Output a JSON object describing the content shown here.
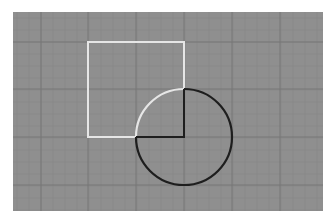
{
  "figure": {
    "width": 330,
    "height": 221,
    "background": "#ffffff",
    "panel": {
      "x": 13,
      "y": 12,
      "width": 310,
      "height": 199,
      "fill": "#8f8f8f"
    },
    "grid": {
      "major_color": "#777777",
      "minor_color": "#868686",
      "major_x": [
        41,
        88,
        136,
        184,
        232,
        280
      ],
      "major_y": [
        42,
        89,
        137,
        185
      ],
      "minor_step": 12
    },
    "square": {
      "x": 88,
      "y": 42,
      "width": 96,
      "height": 95,
      "stroke": "#e6e6e6",
      "stroke_width": 2
    },
    "circle": {
      "cx": 184,
      "cy": 137,
      "r": 48,
      "stroke": "#1e1e1e",
      "stroke_width": 2.2,
      "highlight_arc_stroke": "#e6e6e6"
    },
    "quadrant": {
      "stroke": "#1e1e1e",
      "stroke_width": 2
    }
  }
}
